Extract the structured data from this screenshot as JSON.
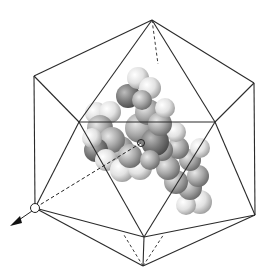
{
  "figure": {
    "colors": {
      "background": "#ffffff",
      "edge": "#2a2a2a",
      "atom_dark": "#6e6e6e",
      "atom_mid": "#9a9a9a",
      "atom_light": "#e6e6e6"
    },
    "vertices": {
      "top": [
        152,
        20
      ],
      "upper_left": [
        34,
        76
      ],
      "upper_right": [
        254,
        83
      ],
      "inner_left": [
        79,
        122
      ],
      "inner_right": [
        215,
        122
      ],
      "lower_left": [
        35,
        208
      ],
      "lower_right": [
        255,
        215
      ],
      "inner_bottom": [
        144,
        237
      ],
      "bottom": [
        143,
        266
      ],
      "center": [
        141,
        143
      ]
    },
    "axis": {
      "from": [
        141,
        143
      ],
      "to": [
        8,
        228
      ],
      "marker": "open-circle at lower-left vertex, arrowhead beyond"
    }
  }
}
